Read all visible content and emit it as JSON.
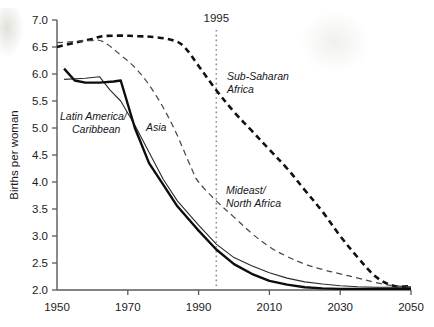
{
  "chart_data": {
    "type": "line",
    "title": "",
    "xlabel": "",
    "ylabel": "Births per woman",
    "xlim": [
      1950,
      2050
    ],
    "ylim": [
      2.0,
      7.0
    ],
    "xticks": [
      "1950",
      "1970",
      "1990",
      "2010",
      "2030",
      "2050"
    ],
    "xtick_values": [
      1950,
      1970,
      1990,
      2010,
      2030,
      2050
    ],
    "yticks": [
      "2.0",
      "2.5",
      "3.0",
      "3.5",
      "4.0",
      "4.5",
      "5.0",
      "5.5",
      "6.0",
      "6.5",
      "7.0"
    ],
    "ytick_values": [
      2.0,
      2.5,
      3.0,
      3.5,
      4.0,
      4.5,
      5.0,
      5.5,
      6.0,
      6.5,
      7.0
    ],
    "grid": false,
    "legend_position": "inline-annotations",
    "annotations": [
      {
        "name": "year-marker",
        "text": "1995",
        "x": 1995,
        "style": "vertical dotted line"
      }
    ],
    "series": [
      {
        "name": "Sub-Saharan Africa",
        "label": "Sub-Saharan\nAfrica",
        "label_lines": [
          "Sub-Saharan",
          "Africa"
        ],
        "style": "thick-dashed",
        "color": "#111111",
        "x": [
          1950,
          1955,
          1960,
          1963,
          1968,
          1973,
          1978,
          1983,
          1986,
          1990,
          1995,
          2000,
          2005,
          2010,
          2015,
          2020,
          2025,
          2030,
          2035,
          2040,
          2045,
          2050
        ],
        "y": [
          6.5,
          6.58,
          6.65,
          6.7,
          6.71,
          6.7,
          6.68,
          6.62,
          6.5,
          6.15,
          5.7,
          5.3,
          4.95,
          4.6,
          4.25,
          3.85,
          3.45,
          3.0,
          2.6,
          2.25,
          2.08,
          2.07
        ]
      },
      {
        "name": "Mideast/North Africa",
        "label": "Mideast/\nNorth Africa",
        "label_lines": [
          "Mideast/",
          "North Africa"
        ],
        "style": "thin-dashed",
        "color": "#4a4a4a",
        "x": [
          1950,
          1955,
          1960,
          1963,
          1968,
          1973,
          1978,
          1983,
          1988,
          1990,
          1995,
          2000,
          2005,
          2010,
          2015,
          2020,
          2025,
          2030,
          2035,
          2040,
          2045,
          2050
        ],
        "y": [
          6.58,
          6.6,
          6.62,
          6.6,
          6.35,
          6.05,
          5.6,
          5.0,
          4.25,
          4.0,
          3.65,
          3.35,
          3.05,
          2.8,
          2.62,
          2.48,
          2.38,
          2.3,
          2.22,
          2.14,
          2.08,
          2.06
        ]
      },
      {
        "name": "Asia",
        "label": "Asia",
        "label_lines": [
          "Asia"
        ],
        "style": "thin-solid",
        "color": "#2a2a2a",
        "x": [
          1952,
          1958,
          1962,
          1965,
          1968,
          1972,
          1976,
          1980,
          1984,
          1988,
          1990,
          1995,
          2000,
          2005,
          2010,
          2015,
          2020,
          2025,
          2030,
          2035,
          2040,
          2045,
          2050
        ],
        "y": [
          5.9,
          5.92,
          5.95,
          5.7,
          5.5,
          5.05,
          4.55,
          4.05,
          3.65,
          3.35,
          3.2,
          2.85,
          2.6,
          2.45,
          2.32,
          2.22,
          2.15,
          2.11,
          2.08,
          2.06,
          2.05,
          2.05,
          2.05
        ]
      },
      {
        "name": "Latin America/Caribbean",
        "label": "Latin America/\nCaribbean",
        "label_lines": [
          "Latin America/",
          "Caribbean"
        ],
        "style": "thick-solid",
        "color": "#0d0d0d",
        "x": [
          1952,
          1955,
          1958,
          1962,
          1966,
          1968,
          1972,
          1976,
          1980,
          1984,
          1988,
          1990,
          1995,
          2000,
          2005,
          2010,
          2015,
          2020,
          2025,
          2030,
          2035,
          2040,
          2045,
          2050
        ],
        "y": [
          6.1,
          5.88,
          5.84,
          5.84,
          5.86,
          5.88,
          5.0,
          4.35,
          3.95,
          3.55,
          3.25,
          3.1,
          2.75,
          2.48,
          2.3,
          2.17,
          2.1,
          2.05,
          2.03,
          2.02,
          2.02,
          2.02,
          2.02,
          2.02
        ]
      }
    ]
  },
  "labels": {
    "ylabel": "Births per woman",
    "marker_1995": "1995"
  }
}
